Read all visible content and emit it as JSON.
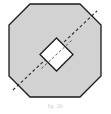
{
  "figure": {
    "background_color": "#ffffff",
    "caption": "ﬁg. 2b",
    "caption_color": "#b4b4b4",
    "outline_color": "#1a1a1a",
    "outer_shape": {
      "name": "chamfered-octagon",
      "fill_color": "#d2d2d2",
      "stroke_color": "#1a1a1a",
      "stroke_width": 1.3,
      "bounds": {
        "x": 9,
        "y": 4,
        "width": 92,
        "height": 93
      },
      "chamfer": 21,
      "points": "30,4 80,4 101,25 101,76 80,97 30,97 9,76 9,25"
    },
    "inner_shape": {
      "name": "rotated-square-diamond",
      "fill_color": "#ffffff",
      "stroke_color": "#1a1a1a",
      "stroke_width": 1.3,
      "bounds": {
        "x": 40,
        "y": 38,
        "width": 33,
        "height": 33
      },
      "center": {
        "x": 56.5,
        "y": 54.5
      },
      "rotation_deg": 45,
      "points": "56.5,38 73,54.5 56.5,71 40,54.5"
    },
    "section_line": {
      "name": "diagonal-dashed-section-line",
      "stroke_color": "#2a2a2a",
      "stroke_width": 1.1,
      "dash_pattern": "3 2.4",
      "start": {
        "x": 13,
        "y": 90
      },
      "end": {
        "x": 97,
        "y": 11
      }
    }
  }
}
